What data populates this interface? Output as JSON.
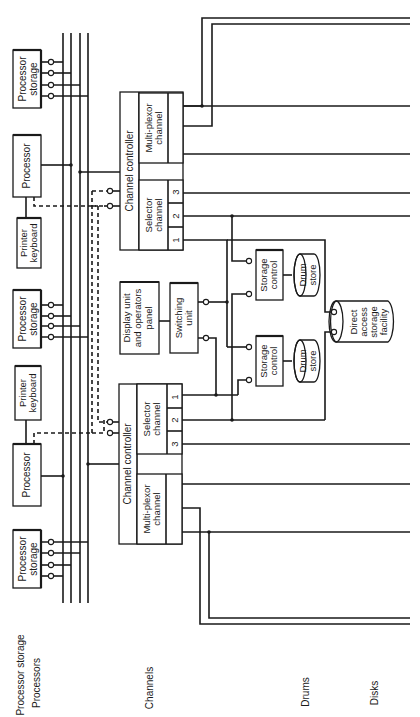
{
  "figure": {
    "orientation": "rotated-90-ccw",
    "row_labels": {
      "processor_storage": "Processor storage",
      "processors": "Processors",
      "channels": "Channels",
      "drums": "Drums",
      "disks": "Disks"
    },
    "processor_storage_units": [
      {
        "label_line1": "Processor",
        "label_line2": "storage"
      },
      {
        "label_line1": "Processor",
        "label_line2": "storage"
      },
      {
        "label_line1": "Processor",
        "label_line2": "storage"
      }
    ],
    "processors": [
      {
        "label": "Processor"
      },
      {
        "label": "Processor"
      }
    ],
    "printer_keyboards": [
      {
        "label_line1": "Printer",
        "label_line2": "keyboard"
      },
      {
        "label_line1": "Printer",
        "label_line2": "keyboard"
      }
    ],
    "channel_controllers": [
      {
        "title": "Channel controller",
        "multiplexor": {
          "label_line1": "Multi-plexor",
          "label_line2": "channel"
        },
        "selector": {
          "label_line1": "Selector",
          "label_line2": "channel",
          "ports": [
            "1",
            "2",
            "3"
          ]
        }
      },
      {
        "title": "Channel controller",
        "multiplexor": {
          "label_line1": "Multi-plexor",
          "label_line2": "channel"
        },
        "selector": {
          "label_line1": "Selector",
          "label_line2": "channel",
          "ports": [
            "1",
            "2",
            "3"
          ]
        }
      }
    ],
    "display_unit": {
      "line1": "Display unit",
      "line2": "and operators",
      "line3": "panel"
    },
    "switching_unit": {
      "line1": "Switching",
      "line2": "unit"
    },
    "storage_controls": [
      {
        "line1": "Storage",
        "line2": "control"
      },
      {
        "line1": "Storage",
        "line2": "control"
      }
    ],
    "drum_stores": [
      {
        "line1": "Drum",
        "line2": "store"
      },
      {
        "line1": "Drum",
        "line2": "store"
      }
    ],
    "direct_access": {
      "line1": "Direct",
      "line2": "access",
      "line3": "storage",
      "line4": "facility"
    }
  }
}
